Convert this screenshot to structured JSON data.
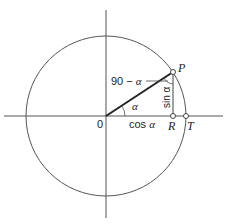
{
  "diagram": {
    "origin_label": "0",
    "point_p_label": "P",
    "point_r_label": "R",
    "point_t_label": "T",
    "angle_label": "α",
    "complement_label_prefix": "90 −",
    "complement_label_symbol": "α",
    "sin_label": "sin α",
    "cos_label_prefix": "cos",
    "cos_label_symbol": "α",
    "colors": {
      "line": "#333333",
      "background": "#ffffff"
    }
  }
}
